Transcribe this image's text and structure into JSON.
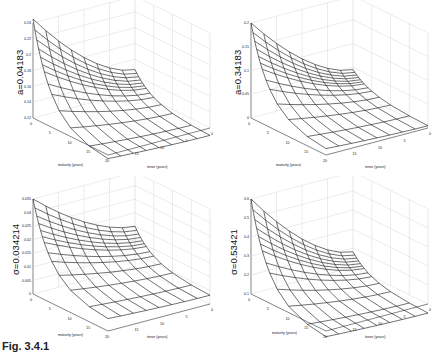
{
  "caption": "Fig. 3.4.1",
  "chart_data": [
    {
      "type": "surface",
      "title": "",
      "zlabel": "a=0.04183",
      "xlabel": "maturity (years)",
      "ylabel": "tenor (years)",
      "x_ticks": [
        0,
        5,
        10,
        15,
        20
      ],
      "y_ticks": [
        15,
        10,
        5,
        0
      ],
      "z_ticks": [
        0.12,
        0.14,
        0.16,
        0.18,
        0.2,
        0.22,
        0.24
      ],
      "zlim": [
        0.12,
        0.24
      ],
      "grid": true,
      "corner_values": {
        "m0_t0": 0.147,
        "m20_t0": 0.11,
        "m0_t20": 0.245,
        "m20_t20": 0.113,
        "m10_t10": 0.125
      }
    },
    {
      "type": "surface",
      "title": "",
      "zlabel": "a=0.34183",
      "xlabel": "maturity (years)",
      "ylabel": "tenor (years)",
      "x_ticks": [
        0,
        5,
        10,
        15,
        20
      ],
      "y_ticks": [
        15,
        10,
        5,
        0
      ],
      "z_ticks": [
        0,
        0.05,
        0.1,
        0.15,
        0.2
      ],
      "zlim": [
        0,
        0.2
      ],
      "grid": true,
      "corner_values": {
        "m0_t0": 0.045,
        "m20_t0": 0.004,
        "m0_t20": 0.2,
        "m20_t20": 0.01,
        "m10_t10": 0.012
      }
    },
    {
      "type": "surface",
      "title": "",
      "zlabel": "σ=0.034214",
      "xlabel": "maturity (years)",
      "ylabel": "tenor (years)",
      "x_ticks": [
        0,
        5,
        10,
        15,
        20
      ],
      "y_ticks": [
        15,
        10,
        5,
        0
      ],
      "z_ticks": [
        0,
        0.005,
        0.01,
        0.015,
        0.02,
        0.025,
        0.03,
        0.035
      ],
      "zlim": [
        0,
        0.035
      ],
      "grid": true,
      "corner_values": {
        "m0_t0": 0.015,
        "m20_t0": 0.003,
        "m0_t20": 0.035,
        "m20_t20": 0.004,
        "m10_t10": 0.006
      }
    },
    {
      "type": "surface",
      "title": "",
      "zlabel": "σ=0.53421",
      "xlabel": "maturity (years)",
      "ylabel": "tenor (years)",
      "x_ticks": [
        0,
        5,
        10,
        15,
        20
      ],
      "y_ticks": [
        15,
        10,
        5,
        0
      ],
      "z_ticks": [
        0.1,
        0.2,
        0.3,
        0.4,
        0.5,
        0.6
      ],
      "zlim": [
        0.1,
        0.6
      ],
      "grid": true,
      "corner_values": {
        "m0_t0": 0.18,
        "m20_t0": 0.05,
        "m0_t20": 0.6,
        "m20_t20": 0.06,
        "m10_t10": 0.08
      }
    }
  ]
}
